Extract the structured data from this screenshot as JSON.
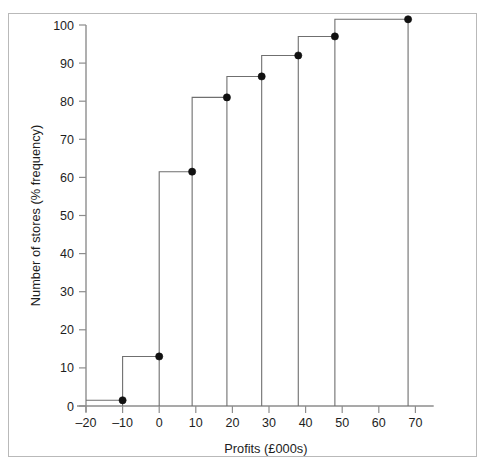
{
  "figure": {
    "background_color": "#ffffff",
    "frame_color": "#b9b9b9",
    "line_color": "#6f6f6f",
    "marker_color": "#111111",
    "axis_color": "#8d8d8d"
  },
  "chart_data": {
    "type": "line",
    "subtype": "cumulative-frequency-step-ogive",
    "title": "",
    "subtitle": "",
    "xlabel": "Profits (£000s)",
    "ylabel": "Number of stores (% frequency)",
    "xlim": [
      -20,
      75
    ],
    "ylim": [
      0,
      103
    ],
    "grid": false,
    "legend": false,
    "legend_position": "none",
    "xticks": [
      -20,
      -10,
      0,
      10,
      20,
      30,
      40,
      50,
      60,
      70
    ],
    "xtick_labels": [
      "–20",
      "–10",
      "0",
      "10",
      "20",
      "30",
      "40",
      "50",
      "60",
      "70"
    ],
    "yticks": [
      0,
      10,
      20,
      30,
      40,
      50,
      60,
      70,
      80,
      90,
      100
    ],
    "ytick_labels": [
      "0",
      "10",
      "20",
      "30",
      "40",
      "50",
      "60",
      "70",
      "80",
      "90",
      "100"
    ],
    "x": [
      -10,
      0,
      9,
      18.5,
      28,
      38,
      48,
      68
    ],
    "y": [
      1.5,
      13,
      61.5,
      81,
      86.5,
      92,
      97,
      101.5
    ],
    "points": [
      {
        "x": -10,
        "y": 1.5
      },
      {
        "x": 0,
        "y": 13
      },
      {
        "x": 9,
        "y": 61.5
      },
      {
        "x": 18.5,
        "y": 81
      },
      {
        "x": 28,
        "y": 86.5
      },
      {
        "x": 38,
        "y": 92
      },
      {
        "x": 48,
        "y": 97
      },
      {
        "x": 68,
        "y": 101.5
      }
    ],
    "step_start_x": -20,
    "series": [
      {
        "name": "Cumulative % frequency",
        "values": [
          1.5,
          13,
          61.5,
          81,
          86.5,
          92,
          97,
          101.5
        ]
      }
    ]
  }
}
